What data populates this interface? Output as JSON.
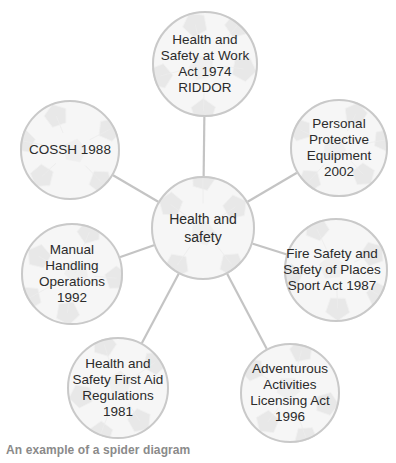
{
  "diagram": {
    "type": "spider",
    "center": {
      "id": "center",
      "label": "Health and\nsafety"
    },
    "nodes": [
      {
        "id": "hasawa",
        "label": "Health and\nSafety at Work\nAct 1974\nRIDDOR"
      },
      {
        "id": "ppe",
        "label": "Personal\nProtective\nEquipment\n2002"
      },
      {
        "id": "fire",
        "label": "Fire Safety and\nSafety of Places\nSport Act 1987"
      },
      {
        "id": "adventurous",
        "label": "Adventurous\nActivities\nLicensing Act\n1996"
      },
      {
        "id": "first-aid",
        "label": "Health and\nSafety First Aid\nRegulations\n1981"
      },
      {
        "id": "manual",
        "label": "Manual\nHandling\nOperations\n1992"
      },
      {
        "id": "cossh",
        "label": "COSSH 1988"
      }
    ],
    "edges": [
      [
        "center",
        "hasawa"
      ],
      [
        "center",
        "ppe"
      ],
      [
        "center",
        "fire"
      ],
      [
        "center",
        "adventurous"
      ],
      [
        "center",
        "first-aid"
      ],
      [
        "center",
        "manual"
      ],
      [
        "center",
        "cossh"
      ]
    ],
    "colors": {
      "ball_fill": "#f1f1f1",
      "ball_stroke": "#c9c9c9",
      "patch": "#dcdcdc",
      "edge": "#c4c4c4",
      "text": "#2b2b2b",
      "caption": "#8a8a8a"
    }
  },
  "caption": "An example of a spider diagram"
}
